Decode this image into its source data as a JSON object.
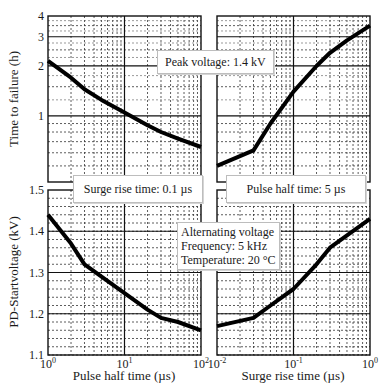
{
  "annotations": {
    "peak_voltage": "Peak voltage: 1.4 kV",
    "surge_rise_time": "Surge rise time: 0.1 µs",
    "pulse_half_time": "Pulse half time: 5 µs",
    "ac_line1": "Alternating voltage",
    "ac_line2": "Frequency: 5 kHz",
    "ac_line3": "Temperature: 20 °C"
  },
  "axes": {
    "y_top_label": "Time to failure (h)",
    "y_bottom_label": "PD-Startvoltage (kV)",
    "x_left_label": "Pulse half time (µs)",
    "x_right_label": "Surge rise time (µs)"
  },
  "chart_data": [
    {
      "type": "line",
      "panel": "top-left",
      "title": "",
      "xlabel": "Pulse half time (µs)",
      "ylabel": "Time to failure (h)",
      "xscale": "log",
      "yscale": "log",
      "xlim": [
        1,
        100
      ],
      "ylim": [
        0.4,
        4
      ],
      "x_ticks": [
        "10^0",
        "10^1",
        "10^2"
      ],
      "y_ticks": [
        "1",
        "2",
        "3",
        "4"
      ],
      "grid": true,
      "annotation": "Peak voltage: 1.4 kV",
      "series": [
        {
          "name": "Time to failure",
          "x": [
            1,
            2,
            3,
            5,
            10,
            20,
            30,
            50,
            100
          ],
          "y": [
            2.15,
            1.7,
            1.45,
            1.25,
            1.05,
            0.88,
            0.8,
            0.73,
            0.65
          ]
        }
      ]
    },
    {
      "type": "line",
      "panel": "top-right",
      "title": "",
      "xlabel": "Surge rise time (µs)",
      "ylabel": "Time to failure (h)",
      "xscale": "log",
      "yscale": "log",
      "xlim": [
        0.01,
        1
      ],
      "ylim": [
        0.4,
        4
      ],
      "x_ticks": [
        "10^-2",
        "10^-1",
        "10^0"
      ],
      "y_ticks": [
        "1",
        "2",
        "3",
        "4"
      ],
      "grid": true,
      "series": [
        {
          "name": "Time to failure",
          "x": [
            0.01,
            0.03,
            0.05,
            0.1,
            0.2,
            0.3,
            0.5,
            1
          ],
          "y": [
            0.5,
            0.62,
            0.9,
            1.4,
            2.0,
            2.4,
            2.85,
            3.5
          ]
        }
      ]
    },
    {
      "type": "line",
      "panel": "bottom-left",
      "title": "",
      "xlabel": "Pulse half time (µs)",
      "ylabel": "PD-Startvoltage (kV)",
      "xscale": "log",
      "yscale": "linear",
      "xlim": [
        1,
        100
      ],
      "ylim": [
        1.1,
        1.5
      ],
      "x_ticks": [
        "10^0",
        "10^1",
        "10^2"
      ],
      "y_ticks": [
        "1.1",
        "1.2",
        "1.3",
        "1.4",
        "1.5"
      ],
      "grid": true,
      "annotation": "Surge rise time: 0.1 µs",
      "series": [
        {
          "name": "PD-Startvoltage",
          "x": [
            1,
            2,
            3,
            5,
            10,
            20,
            30,
            50,
            100
          ],
          "y": [
            1.44,
            1.37,
            1.32,
            1.29,
            1.25,
            1.21,
            1.19,
            1.18,
            1.16
          ]
        }
      ]
    },
    {
      "type": "line",
      "panel": "bottom-right",
      "title": "",
      "xlabel": "Surge rise time (µs)",
      "ylabel": "PD-Startvoltage (kV)",
      "xscale": "log",
      "yscale": "linear",
      "xlim": [
        0.01,
        1
      ],
      "ylim": [
        1.1,
        1.5
      ],
      "x_ticks": [
        "10^-2",
        "10^-1",
        "10^0"
      ],
      "y_ticks": [
        "1.1",
        "1.2",
        "1.3",
        "1.4",
        "1.5"
      ],
      "grid": true,
      "annotation": "Pulse half time: 5 µs; Alternating voltage, Frequency: 5 kHz, Temperature: 20 °C",
      "series": [
        {
          "name": "PD-Startvoltage",
          "x": [
            0.01,
            0.03,
            0.05,
            0.1,
            0.2,
            0.3,
            0.5,
            1
          ],
          "y": [
            1.17,
            1.19,
            1.22,
            1.26,
            1.32,
            1.36,
            1.39,
            1.43
          ]
        }
      ]
    }
  ]
}
